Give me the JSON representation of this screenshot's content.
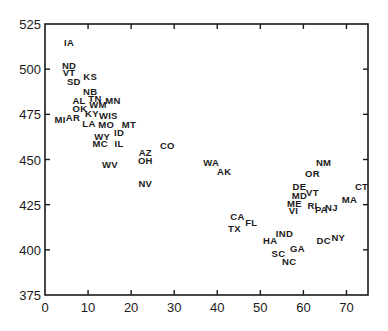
{
  "chart_data": {
    "type": "scatter",
    "title": "",
    "xlabel": "",
    "ylabel": "",
    "xlim": [
      0,
      75
    ],
    "ylim": [
      375,
      525
    ],
    "x_ticks": [
      0,
      10,
      20,
      30,
      40,
      50,
      60,
      70
    ],
    "y_ticks": [
      375,
      400,
      425,
      450,
      475,
      500,
      525
    ],
    "grid": false,
    "legend": null,
    "marker": "text-label",
    "points": [
      {
        "label": "IA",
        "x": 5.6,
        "y": 514.5
      },
      {
        "label": "ND",
        "x": 5.6,
        "y": 501.8
      },
      {
        "label": "VT",
        "x": 5.6,
        "y": 497.9
      },
      {
        "label": "KS",
        "x": 10.5,
        "y": 496.2
      },
      {
        "label": "SD",
        "x": 6.7,
        "y": 492.9
      },
      {
        "label": "NB",
        "x": 10.5,
        "y": 487.9
      },
      {
        "label": "TN",
        "x": 11.6,
        "y": 484.0
      },
      {
        "label": "MN",
        "x": 15.8,
        "y": 482.4
      },
      {
        "label": "AL",
        "x": 7.9,
        "y": 482.4
      },
      {
        "label": "WM",
        "x": 12.3,
        "y": 480.2
      },
      {
        "label": "OK",
        "x": 8.1,
        "y": 478.5
      },
      {
        "label": "KY",
        "x": 10.9,
        "y": 475.2
      },
      {
        "label": "WIS",
        "x": 14.7,
        "y": 474.6
      },
      {
        "label": "MI",
        "x": 3.5,
        "y": 472.4
      },
      {
        "label": "AR",
        "x": 6.5,
        "y": 473.0
      },
      {
        "label": "LA",
        "x": 10.2,
        "y": 470.2
      },
      {
        "label": "MO",
        "x": 14.2,
        "y": 469.1
      },
      {
        "label": "MT",
        "x": 19.5,
        "y": 469.1
      },
      {
        "label": "WY",
        "x": 13.3,
        "y": 463.0
      },
      {
        "label": "ID",
        "x": 17.2,
        "y": 464.7
      },
      {
        "label": "MC",
        "x": 12.8,
        "y": 458.6
      },
      {
        "label": "IL",
        "x": 17.2,
        "y": 459.1
      },
      {
        "label": "WV",
        "x": 15.1,
        "y": 447.5
      },
      {
        "label": "CO",
        "x": 28.4,
        "y": 457.5
      },
      {
        "label": "AZ",
        "x": 23.3,
        "y": 453.6
      },
      {
        "label": "OH",
        "x": 23.3,
        "y": 449.2
      },
      {
        "label": "NV",
        "x": 23.3,
        "y": 436.5
      },
      {
        "label": "WA",
        "x": 38.6,
        "y": 448.6
      },
      {
        "label": "AK",
        "x": 41.6,
        "y": 443.1
      },
      {
        "label": "NM",
        "x": 64.7,
        "y": 448.6
      },
      {
        "label": "OR",
        "x": 62.1,
        "y": 442.0
      },
      {
        "label": "CT",
        "x": 73.5,
        "y": 435.3
      },
      {
        "label": "DE",
        "x": 59.1,
        "y": 435.3
      },
      {
        "label": "VT",
        "x": 62.1,
        "y": 431.5
      },
      {
        "label": "MD",
        "x": 59.1,
        "y": 429.8
      },
      {
        "label": "MA",
        "x": 70.7,
        "y": 427.6
      },
      {
        "label": "ME",
        "x": 57.9,
        "y": 425.4
      },
      {
        "label": "RI",
        "x": 62.1,
        "y": 424.8
      },
      {
        "label": "PA",
        "x": 64.2,
        "y": 422.6
      },
      {
        "label": "NJ",
        "x": 66.5,
        "y": 423.7
      },
      {
        "label": "VI",
        "x": 57.7,
        "y": 421.5
      },
      {
        "label": "CA",
        "x": 44.7,
        "y": 418.2
      },
      {
        "label": "FL",
        "x": 47.9,
        "y": 415.4
      },
      {
        "label": "TX",
        "x": 44.0,
        "y": 411.6
      },
      {
        "label": "IND",
        "x": 55.6,
        "y": 408.8
      },
      {
        "label": "HA",
        "x": 52.3,
        "y": 404.9
      },
      {
        "label": "NY",
        "x": 68.1,
        "y": 406.6
      },
      {
        "label": "DC",
        "x": 64.7,
        "y": 404.9
      },
      {
        "label": "GA",
        "x": 58.6,
        "y": 401.0
      },
      {
        "label": "SC",
        "x": 54.2,
        "y": 397.7
      },
      {
        "label": "NC",
        "x": 56.7,
        "y": 393.3
      }
    ]
  },
  "colors": {
    "ink": "#1a1a1a",
    "background": "#ffffff"
  }
}
